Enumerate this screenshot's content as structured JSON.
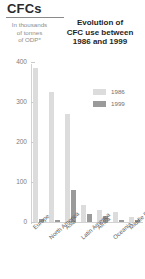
{
  "header": {
    "title": "CFCs",
    "unit_note_line1": "In thousands",
    "unit_note_line2": "of tonnes",
    "unit_note_line3": "of ODP*",
    "main_title_line1": "Evolution of",
    "main_title_line2": "CFC use between",
    "main_title_line3": "1986 and 1999"
  },
  "legend": {
    "position": "inside-top-right",
    "items": [
      {
        "label": "1986",
        "color": "#dcdcdc"
      },
      {
        "label": "1999",
        "color": "#9a9a9a"
      }
    ]
  },
  "colors": {
    "series_1986": "#dcdcdc",
    "series_1999": "#9a9a9a",
    "axis": "#d2d2d2",
    "text": "#5d5d5d",
    "title": "#2b2b2b"
  },
  "chart_data": {
    "type": "bar",
    "title": "Evolution of CFC use between 1986 and 1999",
    "subtitle": "CFCs",
    "xlabel": "",
    "ylabel": "In thousands of tonnes of ODP*",
    "ylim": [
      0,
      400
    ],
    "yticks": [
      0,
      100,
      200,
      300,
      400
    ],
    "ytick_labels": [
      "0",
      "100",
      "200",
      "300",
      "400"
    ],
    "grid": false,
    "legend_position": "inside-top-right",
    "categories": [
      "Europe",
      "North America",
      "Asia",
      "Latin America",
      "Africa",
      "Oceania",
      "Middle East"
    ],
    "series": [
      {
        "name": "1986",
        "color": "#dcdcdc",
        "values": [
          385,
          325,
          270,
          42,
          30,
          24,
          12
        ]
      },
      {
        "name": "1999",
        "color": "#9a9a9a",
        "values": [
          8,
          6,
          80,
          20,
          16,
          5,
          4
        ]
      }
    ],
    "footnote": "* ODP = Ozone Depletion Potential"
  }
}
